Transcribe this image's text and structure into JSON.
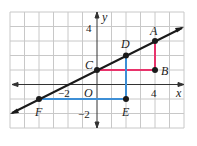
{
  "graph": {
    "x_axis_label": "x",
    "y_axis_label": "y",
    "origin_label": "O",
    "tick_labels": {
      "x_neg2": "−2",
      "x_4": "4",
      "y_4": "4",
      "y_neg2": "−2"
    },
    "x_range": [
      -6,
      6
    ],
    "y_range": [
      -3,
      5
    ],
    "line": {
      "equation": "y = x/2 + 1",
      "color": "#1a1a1a"
    },
    "points": [
      {
        "name": "A",
        "x": 4,
        "y": 3
      },
      {
        "name": "B",
        "x": 4,
        "y": 1
      },
      {
        "name": "C",
        "x": 0,
        "y": 1
      },
      {
        "name": "D",
        "x": 2,
        "y": 2
      },
      {
        "name": "E",
        "x": 2,
        "y": -1
      },
      {
        "name": "F",
        "x": -4,
        "y": -1
      }
    ],
    "segments": [
      {
        "from": "C",
        "to": "B",
        "color": "#e8336b"
      },
      {
        "from": "B",
        "to": "A",
        "color": "#e8336b"
      },
      {
        "from": "F",
        "to": "E",
        "color": "#3d8fd6"
      },
      {
        "from": "E",
        "to": "D",
        "color": "#3d8fd6"
      }
    ],
    "grid_color": "#c8c8c8"
  }
}
